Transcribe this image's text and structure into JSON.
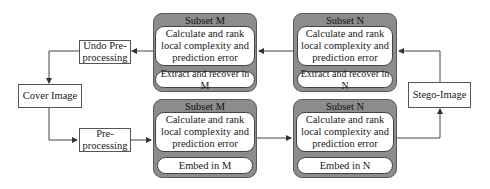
{
  "diagram": {
    "top_row": {
      "subset_m": {
        "title": "Subset M",
        "step1": "Calculate and rank local complexity and prediction error",
        "step2": "Extract and recover in M"
      },
      "subset_n": {
        "title": "Subset N",
        "step1": "Calculate and rank local complexity and prediction error",
        "step2": "Extract and recover in N"
      }
    },
    "bottom_row": {
      "subset_m": {
        "title": "Subset M",
        "step1": "Calculate and rank local complexity and prediction error",
        "step2": "Embed in M"
      },
      "subset_n": {
        "title": "Subset N",
        "step1": "Calculate and rank local complexity and prediction error",
        "step2": "Embed in N"
      }
    },
    "nodes": {
      "undo_preprocessing": "Undo Pre-processing",
      "cover_image": "Cover Image",
      "preprocessing": "Pre-processing",
      "stego_image": "Stego-Image"
    },
    "colors": {
      "subset_fill": "#8c8c8c",
      "box_fill": "#ffffff",
      "line": "#444444"
    }
  }
}
